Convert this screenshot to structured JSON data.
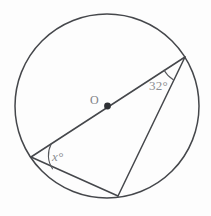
{
  "figure": {
    "type": "circle-geometry-diagram",
    "background_color": "#fdfdfd",
    "line_color": "#45474b",
    "label_color": "#8b8d91",
    "labels": {
      "center": "O",
      "inscribed_angle": "32°",
      "unknown_angle": "x°"
    },
    "circle": {
      "center_x": 107,
      "center_y": 106,
      "radius": 92
    },
    "points": {
      "center": {
        "name": "O",
        "x": 107,
        "y": 106
      },
      "upper_right": {
        "name": "A",
        "x": 185,
        "y": 57
      },
      "lower_left": {
        "name": "B",
        "x": 31,
        "y": 157
      },
      "bottom": {
        "name": "C",
        "x": 118,
        "y": 196
      }
    },
    "segments": [
      {
        "name": "diameter-BA",
        "from": "lower_left",
        "to": "upper_right"
      },
      {
        "name": "chord-AC",
        "from": "upper_right",
        "to": "bottom"
      },
      {
        "name": "chord-BC",
        "from": "lower_left",
        "to": "bottom"
      }
    ],
    "angle_marks": [
      {
        "name": "angle-at-A",
        "vertex": "upper_right",
        "value": "32°"
      },
      {
        "name": "angle-at-B",
        "vertex": "lower_left",
        "value": "x°"
      }
    ]
  }
}
